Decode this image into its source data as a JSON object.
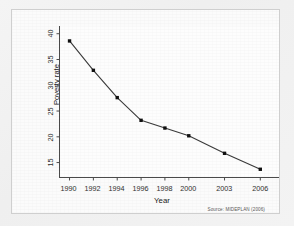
{
  "figure": {
    "source_note": "Source: MIDEPLAN (2006)",
    "frame_color": "#cfcfcf",
    "background_color": "#f2f2f2",
    "plot_background": "#fdfdfd",
    "line_color": "#3a3a3a",
    "marker_color": "#111111"
  },
  "chart_data": {
    "type": "line",
    "title": "",
    "xlabel": "Year",
    "ylabel": "Poverty rate",
    "categories": [
      "1990",
      "1992",
      "1994",
      "1996",
      "1998",
      "2000",
      "2003",
      "2006"
    ],
    "x": [
      1990,
      1992,
      1994,
      1996,
      1998,
      2000,
      2003,
      2006
    ],
    "values": [
      38.6,
      32.9,
      27.6,
      23.2,
      21.7,
      20.2,
      16.8,
      13.7
    ],
    "series": [
      {
        "name": "Poverty rate",
        "values": [
          38.6,
          32.9,
          27.6,
          23.2,
          21.7,
          20.2,
          16.8,
          13.7
        ]
      }
    ],
    "yticks": [
      15,
      20,
      25,
      30,
      35,
      40
    ],
    "ytick_labels": [
      "15",
      "20",
      "25",
      "30",
      "35",
      "40"
    ],
    "xtick_labels": [
      "1990",
      "1992",
      "1994",
      "1996",
      "1998",
      "2000",
      "2003",
      "2006"
    ],
    "ylim": [
      12.2,
      41.5
    ],
    "xlim": [
      1989.2,
      2006.9
    ],
    "grid": false,
    "legend": false,
    "marker": "filled-square"
  }
}
